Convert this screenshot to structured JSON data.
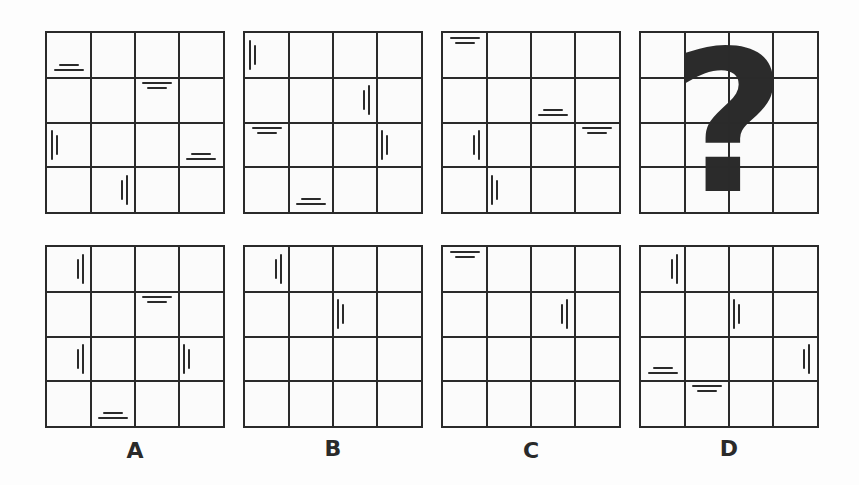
{
  "puzzle": {
    "question_symbol": "?",
    "grid_size": 4,
    "sequence": [
      {
        "id": "seq-1",
        "marks": [
          {
            "row": 0,
            "col": 0,
            "orient": "h",
            "pos": "bottom-center"
          },
          {
            "row": 1,
            "col": 2,
            "orient": "h",
            "pos": "top-center"
          },
          {
            "row": 2,
            "col": 0,
            "orient": "v",
            "pos": "left-middle"
          },
          {
            "row": 2,
            "col": 3,
            "orient": "h",
            "pos": "bottom-center"
          },
          {
            "row": 3,
            "col": 1,
            "orient": "v",
            "pos": "right-middle"
          }
        ]
      },
      {
        "id": "seq-2",
        "marks": [
          {
            "row": 0,
            "col": 0,
            "orient": "v",
            "pos": "left-middle"
          },
          {
            "row": 1,
            "col": 2,
            "orient": "v",
            "pos": "right-middle"
          },
          {
            "row": 2,
            "col": 0,
            "orient": "h",
            "pos": "top-center"
          },
          {
            "row": 2,
            "col": 3,
            "orient": "v",
            "pos": "left-middle"
          },
          {
            "row": 3,
            "col": 1,
            "orient": "h",
            "pos": "bottom-center"
          }
        ]
      },
      {
        "id": "seq-3",
        "marks": [
          {
            "row": 0,
            "col": 0,
            "orient": "h",
            "pos": "top-center"
          },
          {
            "row": 1,
            "col": 2,
            "orient": "h",
            "pos": "bottom-center"
          },
          {
            "row": 2,
            "col": 0,
            "orient": "v",
            "pos": "right-middle"
          },
          {
            "row": 2,
            "col": 3,
            "orient": "h",
            "pos": "top-center"
          },
          {
            "row": 3,
            "col": 1,
            "orient": "v",
            "pos": "left-middle"
          }
        ]
      },
      {
        "id": "seq-4",
        "question": true,
        "marks": []
      }
    ],
    "options": [
      {
        "label": "A",
        "marks": [
          {
            "row": 0,
            "col": 0,
            "orient": "v",
            "pos": "right-middle"
          },
          {
            "row": 1,
            "col": 2,
            "orient": "h",
            "pos": "top-center"
          },
          {
            "row": 2,
            "col": 0,
            "orient": "v",
            "pos": "right-middle"
          },
          {
            "row": 2,
            "col": 3,
            "orient": "v",
            "pos": "left-middle"
          },
          {
            "row": 3,
            "col": 1,
            "orient": "h",
            "pos": "bottom-center"
          }
        ]
      },
      {
        "label": "B",
        "marks": [
          {
            "row": 0,
            "col": 0,
            "orient": "v",
            "pos": "right-middle"
          },
          {
            "row": 1,
            "col": 2,
            "orient": "v",
            "pos": "left-middle"
          }
        ]
      },
      {
        "label": "C",
        "marks": [
          {
            "row": 0,
            "col": 0,
            "orient": "h",
            "pos": "top-center"
          },
          {
            "row": 1,
            "col": 2,
            "orient": "v",
            "pos": "right-middle"
          }
        ]
      },
      {
        "label": "D",
        "marks": [
          {
            "row": 0,
            "col": 0,
            "orient": "v",
            "pos": "right-middle"
          },
          {
            "row": 1,
            "col": 2,
            "orient": "v",
            "pos": "left-middle"
          },
          {
            "row": 2,
            "col": 0,
            "orient": "h",
            "pos": "bottom-center"
          },
          {
            "row": 2,
            "col": 3,
            "orient": "v",
            "pos": "right-middle"
          },
          {
            "row": 3,
            "col": 1,
            "orient": "h",
            "pos": "top-center"
          }
        ]
      }
    ]
  },
  "colors": {
    "line": "#2a2a2a",
    "background": "#fdfdfd"
  }
}
